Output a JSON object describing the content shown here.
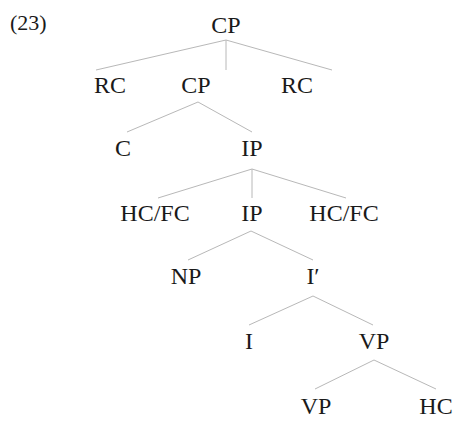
{
  "example_number": "(23)",
  "tree": {
    "nodes": [
      {
        "id": "cp-root",
        "label": "CP",
        "x": 226,
        "y": 12
      },
      {
        "id": "rc-left",
        "label": "RC",
        "x": 110,
        "y": 72
      },
      {
        "id": "cp-inner",
        "label": "CP",
        "x": 196,
        "y": 72
      },
      {
        "id": "rc-right",
        "label": "RC",
        "x": 297,
        "y": 72
      },
      {
        "id": "c",
        "label": "C",
        "x": 123,
        "y": 142
      },
      {
        "id": "ip-upper",
        "label": "IP",
        "x": 252,
        "y": 142
      },
      {
        "id": "hcfc-left",
        "label": "HC/FC",
        "x": 155,
        "y": 204
      },
      {
        "id": "ip-lower",
        "label": "IP",
        "x": 252,
        "y": 204
      },
      {
        "id": "hcfc-right",
        "label": "HC/FC",
        "x": 344,
        "y": 204
      },
      {
        "id": "np",
        "label": "NP",
        "x": 186,
        "y": 265
      },
      {
        "id": "i-bar",
        "label": "I′",
        "x": 311,
        "y": 265
      },
      {
        "id": "i",
        "label": "I",
        "x": 249,
        "y": 330
      },
      {
        "id": "vp-upper",
        "label": "VP",
        "x": 375,
        "y": 330
      },
      {
        "id": "vp-lower",
        "label": "VP",
        "x": 318,
        "y": 394
      },
      {
        "id": "hc",
        "label": "HC",
        "x": 436,
        "y": 394
      }
    ],
    "edges": [
      {
        "from": "cp-root",
        "to": "rc-left"
      },
      {
        "from": "cp-root",
        "to": "cp-inner"
      },
      {
        "from": "cp-root",
        "to": "rc-right"
      },
      {
        "from": "cp-inner",
        "to": "c"
      },
      {
        "from": "cp-inner",
        "to": "ip-upper"
      },
      {
        "from": "ip-upper",
        "to": "hcfc-left"
      },
      {
        "from": "ip-upper",
        "to": "ip-lower"
      },
      {
        "from": "ip-upper",
        "to": "hcfc-right"
      },
      {
        "from": "ip-lower",
        "to": "np"
      },
      {
        "from": "ip-lower",
        "to": "i-bar"
      },
      {
        "from": "i-bar",
        "to": "i"
      },
      {
        "from": "i-bar",
        "to": "vp-upper"
      },
      {
        "from": "vp-upper",
        "to": "vp-lower"
      },
      {
        "from": "vp-upper",
        "to": "hc"
      }
    ]
  },
  "colors": {
    "text": "#1a1a1a",
    "edge": "#b8b8b8",
    "background": "#ffffff"
  }
}
